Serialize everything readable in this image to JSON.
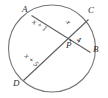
{
  "figure": {
    "stroke_color": "#6e6e6e",
    "label_color": "#2b2b2b",
    "background": "#ffffff"
  },
  "points": [
    {
      "name": "A",
      "label": "A",
      "x": 27,
      "y": 12
    },
    {
      "name": "C",
      "label": "C",
      "x": 91,
      "y": 13
    },
    {
      "name": "B",
      "label": "B",
      "x": 95,
      "y": 50
    },
    {
      "name": "D",
      "label": "D",
      "x": 19,
      "y": 85
    },
    {
      "name": "P",
      "label": "P",
      "x": 70,
      "y": 44
    }
  ],
  "segments": [
    {
      "name": "segment-AP",
      "label": "x + 1",
      "from": "A",
      "to": "P",
      "rotation": -32
    },
    {
      "name": "segment-CP",
      "label": "x",
      "from": "C",
      "to": "P",
      "rotation": 62
    },
    {
      "name": "segment-PB",
      "label": "4",
      "from": "P",
      "to": "B",
      "rotation": 58
    },
    {
      "name": "segment-DP",
      "label": "x + 5",
      "from": "D",
      "to": "P",
      "rotation": -42
    }
  ],
  "chords": [
    {
      "name": "chord-AB",
      "endpoints": [
        "A",
        "B"
      ]
    },
    {
      "name": "chord-CD",
      "endpoints": [
        "C",
        "D"
      ]
    }
  ],
  "circle": {
    "cx": 52,
    "cy": 48.5,
    "r": 43.5
  }
}
